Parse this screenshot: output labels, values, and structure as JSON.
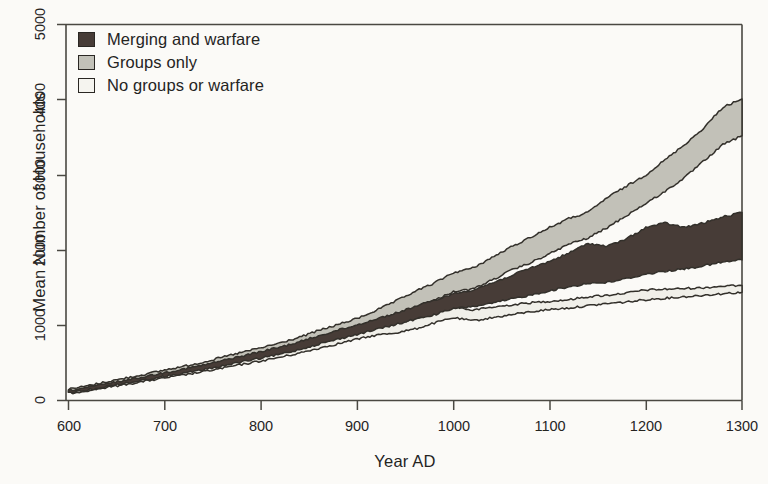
{
  "chart_data": {
    "type": "area",
    "title": "",
    "xlabel": "Year AD",
    "ylabel": "Mean Number of Households",
    "xlim": [
      600,
      1300
    ],
    "ylim": [
      0,
      5000
    ],
    "xticks": [
      600,
      700,
      800,
      900,
      1000,
      1100,
      1200,
      1300
    ],
    "yticks": [
      0,
      1000,
      2000,
      3000,
      4000,
      5000
    ],
    "grid": false,
    "legend_position": "top-left",
    "x": [
      600,
      620,
      640,
      660,
      680,
      700,
      720,
      740,
      760,
      780,
      800,
      820,
      840,
      860,
      880,
      900,
      920,
      940,
      960,
      980,
      1000,
      1020,
      1040,
      1060,
      1080,
      1100,
      1120,
      1140,
      1160,
      1180,
      1200,
      1220,
      1240,
      1260,
      1280,
      1300
    ],
    "series": [
      {
        "name": "Groups only",
        "color": "#c2c1b8",
        "band": true,
        "upper": [
          150,
          195,
          250,
          300,
          350,
          405,
          455,
          510,
          575,
          640,
          700,
          765,
          840,
          930,
          1010,
          1090,
          1200,
          1320,
          1450,
          1560,
          1700,
          1760,
          1900,
          2040,
          2170,
          2300,
          2420,
          2500,
          2700,
          2850,
          3000,
          3200,
          3400,
          3620,
          3900,
          4010
        ],
        "lower": [
          110,
          155,
          205,
          250,
          295,
          345,
          390,
          440,
          495,
          550,
          605,
          665,
          730,
          810,
          880,
          950,
          1030,
          1120,
          1230,
          1330,
          1450,
          1480,
          1600,
          1730,
          1830,
          1950,
          2080,
          2160,
          2300,
          2460,
          2620,
          2780,
          2960,
          3180,
          3400,
          3520
        ]
      },
      {
        "name": "Merging and warfare",
        "color": "#473c37",
        "band": true,
        "upper": [
          130,
          175,
          225,
          272,
          320,
          372,
          420,
          470,
          530,
          590,
          650,
          710,
          780,
          860,
          935,
          1005,
          1085,
          1160,
          1250,
          1330,
          1420,
          1470,
          1560,
          1660,
          1760,
          1850,
          1960,
          2090,
          2050,
          2150,
          2300,
          2360,
          2300,
          2360,
          2440,
          2500
        ],
        "lower": [
          100,
          142,
          188,
          232,
          275,
          320,
          362,
          408,
          460,
          512,
          562,
          615,
          678,
          750,
          815,
          880,
          945,
          1010,
          1080,
          1140,
          1220,
          1250,
          1290,
          1350,
          1400,
          1460,
          1510,
          1560,
          1570,
          1620,
          1680,
          1720,
          1750,
          1790,
          1840,
          1870
        ]
      },
      {
        "name": "No groups or warfare",
        "color": "#f0efe9",
        "band": true,
        "upper": [
          118,
          160,
          208,
          252,
          298,
          345,
          390,
          438,
          492,
          548,
          600,
          655,
          718,
          790,
          855,
          920,
          980,
          1020,
          1080,
          1180,
          1250,
          1200,
          1240,
          1270,
          1300,
          1320,
          1340,
          1380,
          1400,
          1430,
          1470,
          1480,
          1490,
          1500,
          1520,
          1530
        ],
        "lower": [
          95,
          132,
          175,
          215,
          258,
          300,
          340,
          382,
          430,
          478,
          525,
          575,
          630,
          695,
          755,
          815,
          870,
          900,
          950,
          1030,
          1100,
          1060,
          1100,
          1140,
          1180,
          1210,
          1230,
          1260,
          1290,
          1310,
          1340,
          1360,
          1380,
          1400,
          1420,
          1440
        ]
      }
    ]
  },
  "axes": {
    "y_title": "Mean Number of Households",
    "x_title": "Year AD",
    "y_tick_labels": [
      "0",
      "1000",
      "2000",
      "3000",
      "4000",
      "5000"
    ],
    "x_tick_labels": [
      "600",
      "700",
      "800",
      "900",
      "1000",
      "1100",
      "1200",
      "1300"
    ]
  },
  "legend": {
    "items": [
      {
        "label": "Merging and warfare",
        "swatch": "#473c37"
      },
      {
        "label": "Groups only",
        "swatch": "#c2c1b8"
      },
      {
        "label": "No groups or warfare",
        "swatch": "#f5f4ef"
      }
    ]
  },
  "colors": {
    "background": "#fbfaf7",
    "axis": "#4a4842",
    "dark_band": "#473c37",
    "gray_band": "#c2c1b8",
    "light_band": "#f0efe9",
    "outline": "#33302b"
  }
}
